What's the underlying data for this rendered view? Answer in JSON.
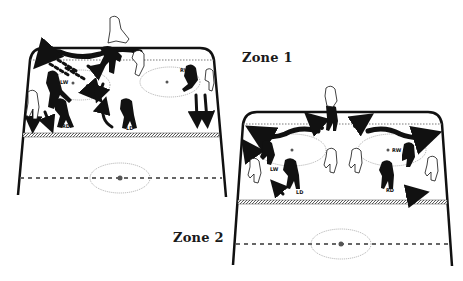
{
  "diagram": {
    "type": "hockey-rink-defensive-zone-illustration",
    "colors": {
      "background": "#ffffff",
      "ink": "#111111",
      "dotted_line": "#888888"
    },
    "zones": [
      {
        "label": "Zone 1",
        "players": [
          {
            "label": "LW",
            "team": "dark"
          },
          {
            "label": "RD",
            "team": "dark"
          },
          {
            "label": "LD",
            "team": "dark"
          },
          {
            "label": "RW",
            "team": "dark"
          }
        ]
      },
      {
        "label": "Zone 2",
        "players": [
          {
            "label": "LW",
            "team": "dark"
          },
          {
            "label": "LD",
            "team": "dark"
          },
          {
            "label": "RW",
            "team": "dark"
          },
          {
            "label": "RD",
            "team": "dark"
          }
        ]
      }
    ]
  }
}
